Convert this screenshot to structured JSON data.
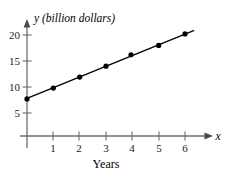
{
  "chart_data": {
    "type": "scatter",
    "title": "",
    "subtitle": "",
    "xlabel": "Years",
    "ylabel": "y (billion dollars)",
    "x_axis_symbol": "x",
    "y_axis_symbol": "y",
    "y_axis_unit_note": "(billion dollars)",
    "xlim": [
      0,
      6.9
    ],
    "ylim": [
      0,
      21.5
    ],
    "x_ticks": [
      1,
      2,
      3,
      4,
      5,
      6
    ],
    "x_tick_labels": [
      "1",
      "2",
      "3",
      "4",
      "5",
      "6"
    ],
    "y_ticks": [
      5,
      10,
      15,
      20
    ],
    "y_tick_labels": [
      "5",
      "10",
      "15",
      "20"
    ],
    "grid": false,
    "legend": false,
    "legend_position": "none",
    "series": [
      {
        "name": "data points",
        "type": "scatter",
        "marker": "filled-circle",
        "color": "#000000",
        "points": [
          {
            "x": 0.0,
            "y": 7.7
          },
          {
            "x": 1.0,
            "y": 9.8
          },
          {
            "x": 2.0,
            "y": 11.9
          },
          {
            "x": 3.0,
            "y": 14.0
          },
          {
            "x": 3.95,
            "y": 16.2
          },
          {
            "x": 5.0,
            "y": 18.0
          },
          {
            "x": 6.0,
            "y": 20.2
          }
        ]
      },
      {
        "name": "trend line",
        "type": "line",
        "color": "#000000",
        "endpoints": [
          {
            "x": 0.0,
            "y": 7.8
          },
          {
            "x": 6.35,
            "y": 20.9
          }
        ]
      }
    ],
    "annotations": []
  },
  "axes": {
    "y_axis_caption": "y (billion dollars)",
    "x_axis_caption": "x",
    "x_axis_title": "Years",
    "y_tick_labels": [
      "20",
      "15",
      "10",
      "5"
    ],
    "x_tick_labels": [
      "1",
      "2",
      "3",
      "4",
      "5",
      "6"
    ]
  },
  "style": {
    "background": "#ffffff",
    "axis_color": "#6e6e6e",
    "data_color": "#000000",
    "text_color": "#000000"
  }
}
